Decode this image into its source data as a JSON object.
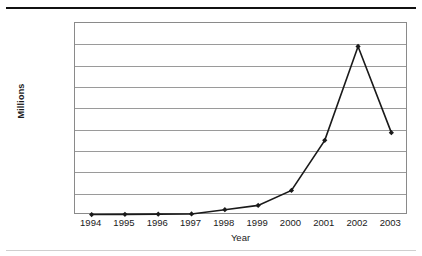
{
  "chart_data": {
    "type": "line",
    "title": "",
    "xlabel": "Year",
    "ylabel": "Millions",
    "categories": [
      "1994",
      "1995",
      "1996",
      "1997",
      "1998",
      "1999",
      "2000",
      "2001",
      "2002",
      "2003"
    ],
    "values": [
      10,
      15,
      20,
      25,
      125,
      225,
      575,
      1750,
      3950,
      1930
    ],
    "series": [
      {
        "name": "",
        "values": [
          10,
          15,
          20,
          25,
          125,
          225,
          575,
          1750,
          3950,
          1930
        ]
      }
    ],
    "ylim": [
      0,
      4500
    ],
    "ytick_values": [
      0,
      500,
      1000,
      1500,
      2000,
      2500,
      3000,
      3500,
      4000,
      4500
    ],
    "ytick_labels": [
      "$0",
      "$500",
      "$1,000",
      "$1,500",
      "$2,000",
      "$2,500",
      "$3,000",
      "$3,500",
      "$4,000",
      "$4,500"
    ],
    "grid": true,
    "legend": "none",
    "line_color": "#1a1a1a",
    "marker": "diamond",
    "marker_color": "#1a1a1a"
  }
}
